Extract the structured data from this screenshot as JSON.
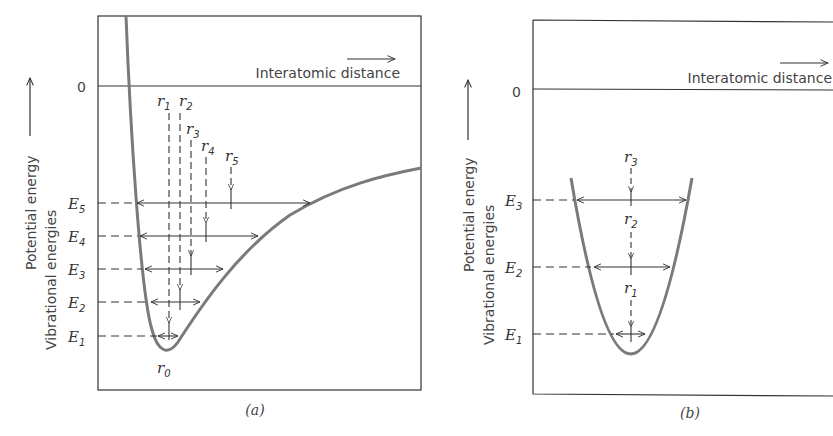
{
  "panels": [
    {
      "id": "a",
      "caption": "(a)",
      "x_axis_label": "Interatomic distance",
      "y_axis_label_1": "Potential energy",
      "y_axis_label_2": "Vibrational energies",
      "zero_label": "0",
      "energy_levels": [
        {
          "sym": "E",
          "sub": "5"
        },
        {
          "sym": "E",
          "sub": "4"
        },
        {
          "sym": "E",
          "sub": "3"
        },
        {
          "sym": "E",
          "sub": "2"
        },
        {
          "sym": "E",
          "sub": "1"
        }
      ],
      "positions": [
        {
          "sym": "r",
          "sub": "0"
        },
        {
          "sym": "r",
          "sub": "1"
        },
        {
          "sym": "r",
          "sub": "2"
        },
        {
          "sym": "r",
          "sub": "3"
        },
        {
          "sym": "r",
          "sub": "4"
        },
        {
          "sym": "r",
          "sub": "5"
        }
      ]
    },
    {
      "id": "b",
      "caption": "(b)",
      "x_axis_label": "Interatomic distance",
      "y_axis_label_1": "Potential energy",
      "y_axis_label_2": "Vibrational energies",
      "zero_label": "0",
      "energy_levels": [
        {
          "sym": "E",
          "sub": "3"
        },
        {
          "sym": "E",
          "sub": "2"
        },
        {
          "sym": "E",
          "sub": "1"
        }
      ],
      "positions": [
        {
          "sym": "r",
          "sub": "3"
        },
        {
          "sym": "r",
          "sub": "2"
        },
        {
          "sym": "r",
          "sub": "1"
        }
      ]
    }
  ],
  "colors": {
    "curve": "#7a7a7a",
    "frame": "#333333",
    "text": "#444444"
  }
}
